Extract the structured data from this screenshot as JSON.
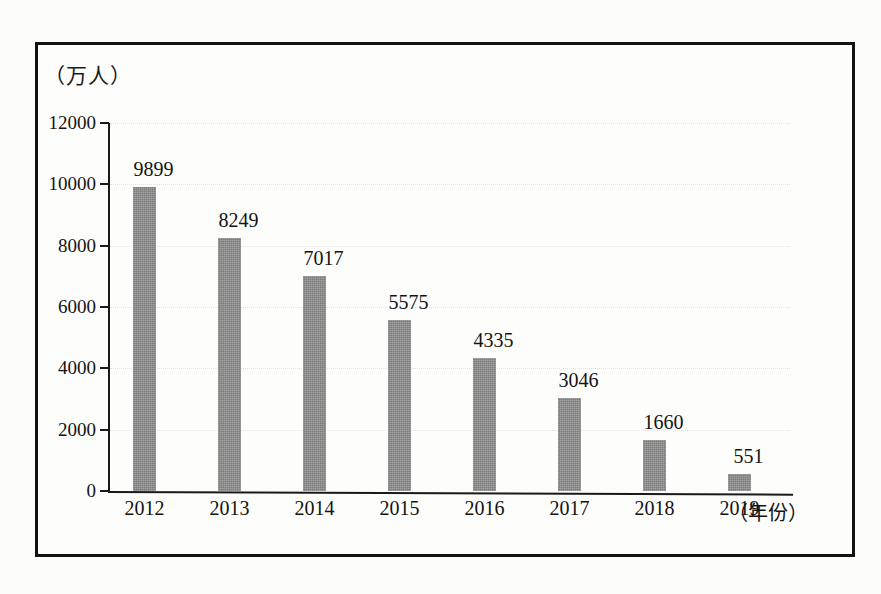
{
  "figure": {
    "y_axis_unit_label": "（万人）",
    "x_axis_unit_label": "（年份）"
  },
  "chart_data": {
    "type": "bar",
    "title": "",
    "xlabel": "（年份）",
    "ylabel": "（万人）",
    "categories": [
      "2012",
      "2013",
      "2014",
      "2015",
      "2016",
      "2017",
      "2018",
      "2019"
    ],
    "values": [
      9899,
      8249,
      7017,
      5575,
      4335,
      3046,
      1660,
      551
    ],
    "value_labels": [
      "9899",
      "8249",
      "7017",
      "5575",
      "4335",
      "3046",
      "1660",
      "551"
    ],
    "ylim": [
      0,
      12000
    ],
    "ytick_labels": [
      "12000",
      "10000",
      "8000",
      "6000",
      "4000",
      "2000",
      "0"
    ],
    "ytick_values": [
      12000,
      10000,
      8000,
      6000,
      4000,
      2000,
      0
    ],
    "grid": true,
    "grid_style": "dotted-horizontal",
    "legend": null,
    "bar_color": "#8c8c8c",
    "axis_color": "#1a1a1a",
    "text_color": "#131313",
    "background_color": "#fdfdfb"
  }
}
